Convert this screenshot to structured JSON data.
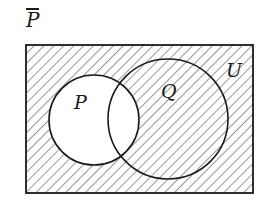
{
  "title": "P",
  "title_notation": "complement (overline)",
  "diagram": {
    "type": "venn",
    "universe_label": "U",
    "sets": [
      {
        "label": "P",
        "cx": 94,
        "cy": 120,
        "r": 45
      },
      {
        "label": "Q",
        "cx": 168,
        "cy": 119,
        "r": 60
      }
    ],
    "shaded_region": "complement of P (everything in U outside circle P)",
    "hatch_color": "#333333",
    "stroke_color": "#1a1a1a"
  }
}
